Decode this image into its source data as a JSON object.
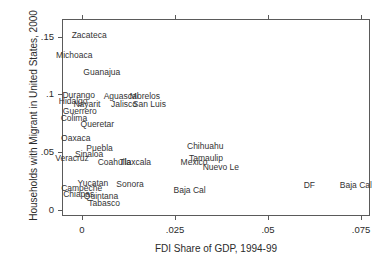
{
  "chart_data": {
    "type": "scatter",
    "title": "",
    "xlabel": "FDI Share of GDP, 1994-99",
    "ylabel": "Households with Migrant in United States, 2000",
    "xlim": [
      -0.0055,
      0.0773
    ],
    "ylim": [
      -0.0055,
      0.1655
    ],
    "xticks": [
      0,
      0.025,
      0.05,
      0.075
    ],
    "xticklabels": [
      "0",
      ".025",
      ".05",
      ".075"
    ],
    "yticks": [
      0,
      0.05,
      0.1,
      0.15
    ],
    "yticklabels": [
      "0",
      ".05",
      ".1",
      ".15"
    ],
    "grid": false,
    "legend": null,
    "marker_style": "text-label-only",
    "points": [
      {
        "label": "Zacateca",
        "x": 0.0018,
        "y": 0.1515
      },
      {
        "label": "Michoaca",
        "x": -0.0022,
        "y": 0.1345
      },
      {
        "label": "Guanajua",
        "x": 0.0052,
        "y": 0.1195
      },
      {
        "label": "Durango",
        "x": -0.001,
        "y": 0.0995
      },
      {
        "label": "Aguascal",
        "x": 0.0104,
        "y": 0.0985
      },
      {
        "label": "Morelos",
        "x": 0.0168,
        "y": 0.0985
      },
      {
        "label": "Hidalgo",
        "x": -0.0025,
        "y": 0.0945
      },
      {
        "label": "Nayarit",
        "x": 0.0012,
        "y": 0.092
      },
      {
        "label": "Jalisco",
        "x": 0.0112,
        "y": 0.092
      },
      {
        "label": "San Luis",
        "x": 0.018,
        "y": 0.092
      },
      {
        "label": "Guerrero",
        "x": -0.0007,
        "y": 0.086
      },
      {
        "label": "Colima",
        "x": -0.0023,
        "y": 0.0795
      },
      {
        "label": "Queretar",
        "x": 0.004,
        "y": 0.074
      },
      {
        "label": "Oaxaca",
        "x": -0.0018,
        "y": 0.062
      },
      {
        "label": "Chihuahu",
        "x": 0.033,
        "y": 0.0555
      },
      {
        "label": "Puebla",
        "x": 0.0046,
        "y": 0.0535
      },
      {
        "label": "Sinaloa",
        "x": 0.0018,
        "y": 0.0485
      },
      {
        "label": "Tamaulip",
        "x": 0.0332,
        "y": 0.045
      },
      {
        "label": "Veracruz",
        "x": -0.0028,
        "y": 0.045
      },
      {
        "label": "Coahuila",
        "x": 0.0086,
        "y": 0.041
      },
      {
        "label": "Tlaxcala",
        "x": 0.0142,
        "y": 0.041
      },
      {
        "label": "Mexico",
        "x": 0.03,
        "y": 0.0415
      },
      {
        "label": "Nuevo Le",
        "x": 0.0372,
        "y": 0.037
      },
      {
        "label": "Yucatan",
        "x": 0.0028,
        "y": 0.023
      },
      {
        "label": "Sonora",
        "x": 0.0128,
        "y": 0.022
      },
      {
        "label": "DF",
        "x": 0.061,
        "y": 0.0215
      },
      {
        "label": "Baja Cal",
        "x": 0.0735,
        "y": 0.0215
      },
      {
        "label": "Campeche",
        "x": -0.0002,
        "y": 0.019
      },
      {
        "label": "Baja Cal",
        "x": 0.0288,
        "y": 0.0175
      },
      {
        "label": "Chiapas",
        "x": -0.001,
        "y": 0.0135
      },
      {
        "label": "Quintana",
        "x": 0.005,
        "y": 0.0115
      },
      {
        "label": "Tabasco",
        "x": 0.0058,
        "y": 0.006
      }
    ]
  },
  "figure": {
    "background_color": "#ffffff",
    "axis_color": "#5a5a5a",
    "text_color": "#2b2b2b"
  }
}
